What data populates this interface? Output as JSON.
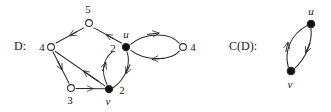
{
  "figure": {
    "panels": [
      {
        "id": "D",
        "label": "D:",
        "label_x": 14,
        "label_y": 46
      },
      {
        "id": "CD",
        "label": "C(D):",
        "label_x": 229,
        "label_y": 46
      }
    ]
  },
  "graph_D": {
    "nodes": [
      {
        "id": "n5",
        "label": "5",
        "filled": false,
        "cx": 89,
        "cy": 23,
        "label_x": 88,
        "label_y": 9
      },
      {
        "id": "n4L",
        "label": "4",
        "filled": false,
        "cx": 51,
        "cy": 47,
        "label_x": 42,
        "label_y": 47
      },
      {
        "id": "u",
        "label": "u",
        "filled": true,
        "cx": 126,
        "cy": 47,
        "label_x": 126,
        "label_y": 34,
        "weight": "2",
        "weight_x": 113,
        "weight_y": 48
      },
      {
        "id": "n4R",
        "label": "4",
        "filled": false,
        "cx": 183,
        "cy": 47,
        "label_x": 193,
        "label_y": 47
      },
      {
        "id": "n3",
        "label": "3",
        "filled": false,
        "cx": 71,
        "cy": 88,
        "label_x": 70,
        "label_y": 100
      },
      {
        "id": "v",
        "label": "v",
        "filled": true,
        "cx": 109,
        "cy": 89,
        "label_x": 108,
        "label_y": 101,
        "weight": "2",
        "weight_x": 122,
        "weight_y": 90
      }
    ],
    "edges": [
      {
        "from": "n5",
        "to": "n4L",
        "type": "straight"
      },
      {
        "from": "u",
        "to": "n5",
        "type": "straight"
      },
      {
        "from": "n4L",
        "to": "n3",
        "type": "straight"
      },
      {
        "from": "n3",
        "to": "v",
        "type": "straight"
      },
      {
        "from": "v",
        "to": "n4L",
        "type": "straight"
      },
      {
        "from": "u",
        "to": "n4R",
        "type": "arc-upper"
      },
      {
        "from": "n4R",
        "to": "u",
        "type": "arc-lower"
      },
      {
        "from": "v",
        "to": "u",
        "type": "arc-left"
      },
      {
        "from": "u",
        "to": "v",
        "type": "arc-right"
      }
    ]
  },
  "graph_CD": {
    "nodes": [
      {
        "id": "u",
        "label": "u",
        "filled": true,
        "cx": 311,
        "cy": 24,
        "label_x": 311,
        "label_y": 11
      },
      {
        "id": "v",
        "label": "v",
        "filled": true,
        "cx": 291,
        "cy": 71,
        "label_x": 290,
        "label_y": 84
      }
    ],
    "edges": [
      {
        "from": "u",
        "to": "v",
        "type": "arc-right"
      },
      {
        "from": "v",
        "to": "u",
        "type": "arc-left"
      }
    ]
  },
  "style": {
    "stroke": "#2b2b2b",
    "node_fill_open": "#ffffff",
    "node_fill_closed": "#111111",
    "text": "#1a1a1a"
  }
}
